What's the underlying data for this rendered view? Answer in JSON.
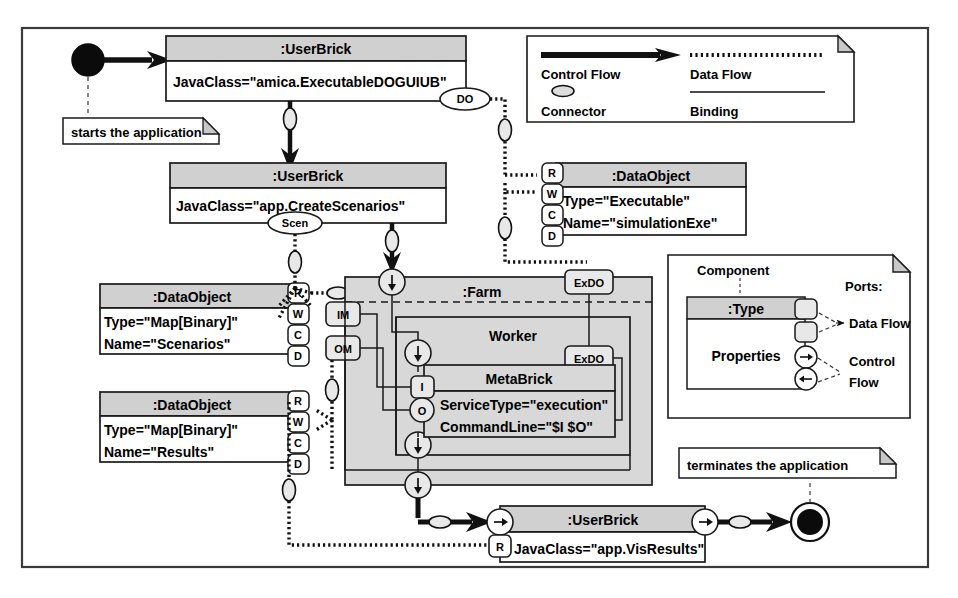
{
  "diagram": {
    "frame": {
      "border_color": "#3a3a3a",
      "background": "#ffffff"
    },
    "colors": {
      "header_fill": "#d0d0d0",
      "body_fill": "#ffffff",
      "container_fill": "#d8d8d8",
      "stroke": "#1a1a1a",
      "note_corner_fill": "#c8c8c8"
    }
  },
  "start_node": {
    "name": "initial-node",
    "note": "starts the application"
  },
  "end_node": {
    "name": "final-node",
    "note": "terminates the application"
  },
  "components": [
    {
      "id": "userbrick-executable",
      "type": ":UserBrick",
      "properties": [
        "JavaClass=\"amica.ExecutableDOGUIUB\""
      ],
      "ports": [
        "DO"
      ]
    },
    {
      "id": "userbrick-createscenarios",
      "type": ":UserBrick",
      "properties": [
        "JavaClass=\"app.CreateScenarios\""
      ],
      "ports": [
        "Scen"
      ]
    },
    {
      "id": "dataobject-simulationexe",
      "type": ":DataObject",
      "properties": [
        "Type=\"Executable\"",
        "Name=\"simulationExe\""
      ],
      "ports": [
        "R",
        "W",
        "C",
        "D"
      ]
    },
    {
      "id": "dataobject-scenarios",
      "type": ":DataObject",
      "properties": [
        "Type=\"Map[Binary]\"",
        "Name=\"Scenarios\""
      ],
      "ports": [
        "R",
        "W",
        "C",
        "D"
      ]
    },
    {
      "id": "dataobject-results",
      "type": ":DataObject",
      "properties": [
        "Type=\"Map[Binary]\"",
        "Name=\"Results\""
      ],
      "ports": [
        "R",
        "W",
        "C",
        "D"
      ]
    },
    {
      "id": "farm",
      "type": ":Farm",
      "properties": [],
      "ports": [
        "IM",
        "OM",
        "ExDO"
      ]
    },
    {
      "id": "worker",
      "type": "Worker",
      "properties": [],
      "ports": [
        "ExDO"
      ]
    },
    {
      "id": "metabrick",
      "type": "MetaBrick",
      "properties": [
        "ServiceType=\"execution\"",
        "CommandLine=\"$I $O\""
      ],
      "ports": [
        "I",
        "O"
      ]
    },
    {
      "id": "userbrick-visresults",
      "type": ":UserBrick",
      "properties": [
        "JavaClass=\"app.VisResults\""
      ],
      "ports": [
        "R"
      ]
    }
  ],
  "legend_flow": {
    "title": "",
    "entries": [
      {
        "label": "Control Flow",
        "glyph": "thick-arrow"
      },
      {
        "label": "Data Flow",
        "glyph": "dotted-line"
      },
      {
        "label": "Connector",
        "glyph": "small-oval"
      },
      {
        "label": "Binding",
        "glyph": "thin-line"
      }
    ]
  },
  "legend_component": {
    "component_label": "Component",
    "type_label": ":Type",
    "properties_label": "Properties",
    "ports_label": "Ports:",
    "port_kinds": [
      {
        "label": "Data Flow",
        "glyph": "rounded-square-port"
      },
      {
        "label": "Control\nFlow",
        "glyph": "circle-arrow-port"
      }
    ],
    "port_kind_1": "Data Flow",
    "port_kind_2a": "Control",
    "port_kind_2b": "Flow"
  }
}
